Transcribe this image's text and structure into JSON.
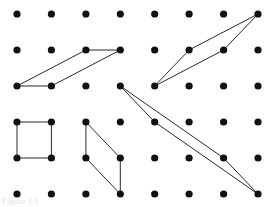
{
  "figure": {
    "caption": "Figure 1.1",
    "background_color": "#ffffff",
    "dot_color": "#111111",
    "line_color": "#2a2a2a",
    "dot_radius": 3.6,
    "line_width": 1.0,
    "width": 277,
    "height": 207
  },
  "grid": {
    "label": "pegboard-dot-grid",
    "columns": 8,
    "rows": 6,
    "origin_x": 17,
    "origin_y": 14,
    "spacing_x": 34.4,
    "spacing_y": 36,
    "col_x": [
      17,
      51.4,
      85.9,
      120.3,
      154.7,
      189.1,
      223.6,
      258
    ],
    "row_y": [
      14,
      50,
      86,
      122,
      158,
      194
    ]
  },
  "shapes": [
    {
      "name": "parallelogram-top-left",
      "description": "Slanted parallelogram in the upper left region",
      "vertices_rc": [
        [
          2,
          0
        ],
        [
          2,
          1
        ],
        [
          1,
          3
        ],
        [
          1,
          2
        ]
      ],
      "points": [
        [
          17,
          86
        ],
        [
          51.4,
          86
        ],
        [
          120.3,
          50
        ],
        [
          85.9,
          50
        ]
      ]
    },
    {
      "name": "parallelogram-top-right",
      "description": "Narrow slanted parallelogram in the upper right region",
      "vertices_rc": [
        [
          2,
          4
        ],
        [
          1,
          5
        ],
        [
          0,
          7
        ],
        [
          1,
          6
        ]
      ],
      "points": [
        [
          154.7,
          86
        ],
        [
          189.1,
          50
        ],
        [
          258,
          14
        ],
        [
          223.6,
          50
        ]
      ]
    },
    {
      "name": "square-bottom-left",
      "description": "Axis aligned unit square in the lower left region",
      "vertices_rc": [
        [
          3,
          0
        ],
        [
          3,
          1
        ],
        [
          4,
          1
        ],
        [
          4,
          0
        ]
      ],
      "points": [
        [
          17,
          122
        ],
        [
          51.4,
          122
        ],
        [
          51.4,
          158
        ],
        [
          17,
          158
        ]
      ]
    },
    {
      "name": "parallelogram-bottom-middle",
      "description": "Slanted parallelogram in the lower middle region",
      "vertices_rc": [
        [
          3,
          2
        ],
        [
          4,
          3
        ],
        [
          5,
          3
        ],
        [
          4,
          2
        ]
      ],
      "points": [
        [
          85.9,
          122
        ],
        [
          120.3,
          158
        ],
        [
          120.3,
          194
        ],
        [
          85.9,
          158
        ]
      ]
    },
    {
      "name": "parallelogram-thin-sliver",
      "description": "Very thin long parallelogram spanning from center to bottom right",
      "vertices_rc": [
        [
          2,
          3
        ],
        [
          3,
          4
        ],
        [
          5,
          7
        ],
        [
          4,
          6
        ]
      ],
      "points": [
        [
          120.3,
          86
        ],
        [
          154.7,
          122
        ],
        [
          258,
          194
        ],
        [
          223.6,
          158
        ]
      ]
    }
  ]
}
